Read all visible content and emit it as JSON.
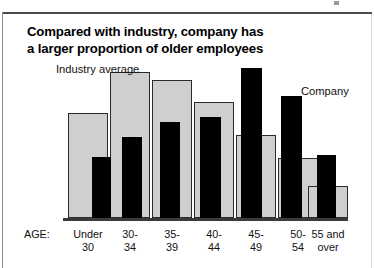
{
  "title": {
    "line1": "Compared with industry, company has",
    "line2": "a larger proportion of older employees"
  },
  "annotations": {
    "industry": "Industry\naverage",
    "industry_line1": "Industry",
    "industry_line2": "average",
    "company": "Company"
  },
  "axis": {
    "label": "AGE:"
  },
  "colors": {
    "industry_fill": "#cfcfcf",
    "industry_stroke": "#2b2b2b",
    "company_fill": "#000000",
    "baseline": "#3a3a3a",
    "text": "#111111",
    "background": "#ffffff"
  },
  "chart_data": {
    "type": "bar",
    "title": "Compared with industry, company has a larger proportion of older employees",
    "xlabel": "AGE:",
    "ylabel": "",
    "grid": false,
    "legend_position": "inline-annotations",
    "categories": [
      "Under 30",
      "30-34",
      "35-39",
      "40-44",
      "45-49",
      "50-54",
      "55 and over"
    ],
    "category_lines": [
      {
        "l1": "Under",
        "l2": "30"
      },
      {
        "l1": "30-",
        "l2": "34"
      },
      {
        "l1": "35-",
        "l2": "39"
      },
      {
        "l1": "40-",
        "l2": "44"
      },
      {
        "l1": "45-",
        "l2": "49"
      },
      {
        "l1": "50-",
        "l2": "54"
      },
      {
        "l1": "55 and",
        "l2": "over"
      }
    ],
    "ylim": [
      0,
      100
    ],
    "series": [
      {
        "name": "Industry average",
        "color": "#cfcfcf",
        "values": [
          70,
          97,
          92,
          77,
          55,
          40,
          21
        ]
      },
      {
        "name": "Company",
        "color": "#000000",
        "values": [
          41,
          54,
          64,
          67,
          100,
          81,
          42
        ]
      }
    ]
  },
  "layout": {
    "baseline_y": 218,
    "plot_left": 63,
    "plot_right": 348,
    "max_bar_px": 150,
    "groups": [
      {
        "x": 68,
        "gray_w": 40,
        "black_x": 24,
        "black_w": 19
      },
      {
        "x": 110,
        "gray_w": 40,
        "black_x": 12,
        "black_w": 20
      },
      {
        "x": 152,
        "gray_w": 40,
        "black_x": 8,
        "black_w": 20
      },
      {
        "x": 194,
        "gray_w": 40,
        "black_x": 6,
        "black_w": 21
      },
      {
        "x": 236,
        "gray_w": 40,
        "black_x": 5,
        "black_w": 21
      },
      {
        "x": 278,
        "gray_w": 40,
        "black_x": 3,
        "black_w": 21
      },
      {
        "x": 308,
        "gray_w": 40,
        "black_x": 9,
        "black_w": 19
      }
    ]
  }
}
